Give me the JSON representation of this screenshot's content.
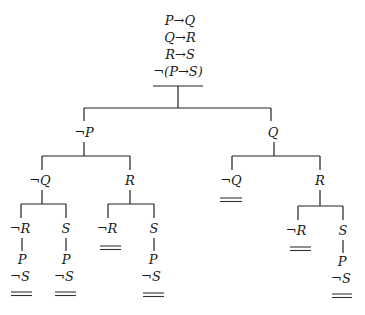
{
  "root": {
    "premises": [
      "P→Q",
      "Q→R",
      "R→S",
      "¬(P→S)"
    ]
  },
  "level1": {
    "left": "¬P",
    "right": "Q"
  },
  "level2": {
    "left_left": "¬Q",
    "left_right": "R",
    "right_left": "¬Q",
    "right_right": "R"
  },
  "level3": {
    "a": {
      "branch": "¬R",
      "chain": [
        "P",
        "¬S"
      ],
      "closed": true
    },
    "b": {
      "branch": "S",
      "chain": [
        "P",
        "¬S"
      ],
      "closed": true
    },
    "c": {
      "branch": "¬R",
      "chain": [],
      "closed": true
    },
    "d": {
      "branch": "S",
      "chain": [
        "P",
        "¬S"
      ],
      "closed": true
    },
    "e": {
      "branch": "¬R",
      "chain": [],
      "closed": true
    },
    "f": {
      "branch": "S",
      "chain": [
        "P",
        "¬S"
      ],
      "closed": true
    }
  },
  "closed_marker": "="
}
